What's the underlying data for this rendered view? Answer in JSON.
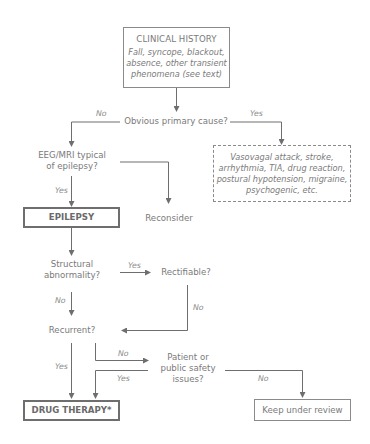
{
  "nodes": {
    "clinical_history": {
      "title": "CLINICAL HISTORY",
      "lines": [
        "Fall, syncope, blackout,",
        "absence, other transient",
        "phenomena (see text)"
      ]
    },
    "obvious_cause": {
      "text": "Obvious primary cause?"
    },
    "alternatives": {
      "lines": [
        "Vasovagal attack, stroke,",
        "arrhythmia, TIA, drug reaction,",
        "postural hypotension, migraine,",
        "psychogenic, etc."
      ]
    },
    "eeg_mri": {
      "lines": [
        "EEG/MRI typical",
        "of epilepsy?"
      ]
    },
    "epilepsy": {
      "text": "EPILEPSY"
    },
    "reconsider": {
      "text": "Reconsider"
    },
    "structural": {
      "lines": [
        "Structural",
        "abnormality?"
      ]
    },
    "rectifiable": {
      "text": "Rectifiable?"
    },
    "recurrent": {
      "text": "Recurrent?"
    },
    "safety": {
      "lines": [
        "Patient or",
        "public safety",
        "issues?"
      ]
    },
    "drug_therapy": {
      "text": "DRUG THERAPY*"
    },
    "keep_review": {
      "text": "Keep under review"
    }
  },
  "edge_labels": {
    "obvious_no": "No",
    "obvious_yes": "Yes",
    "eeg_yes": "Yes",
    "structural_yes": "Yes",
    "structural_no": "No",
    "rectifiable_no": "No",
    "recurrent_yes": "Yes",
    "recurrent_no": "No",
    "safety_yes": "Yes",
    "safety_no": "No"
  },
  "colors": {
    "line": "#6e6e6e",
    "text": "#7a7a7a",
    "border": "#8a8a8a"
  }
}
